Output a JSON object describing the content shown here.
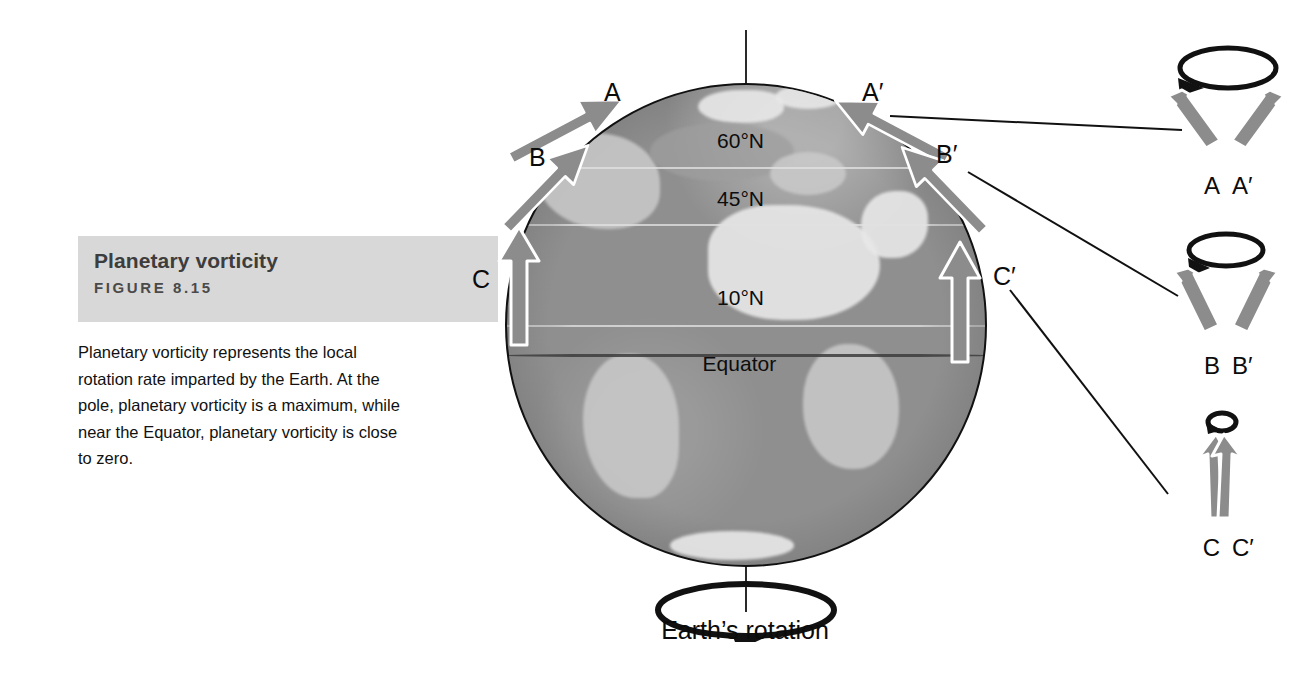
{
  "caption": {
    "title": "Planetary vorticity",
    "figure_number": "FIGURE 8.15",
    "body": "Planetary vorticity represents the local rotation rate imparted by the Earth. At the pole, planetary vorticity is a maximum, while near the Equator, planetary vorticity is close to zero."
  },
  "globe": {
    "latitudes": [
      {
        "label": "60°N"
      },
      {
        "label": "45°N"
      },
      {
        "label": "10°N"
      },
      {
        "label": "Equator"
      }
    ],
    "arrow_labels": {
      "a": "A",
      "b": "B",
      "c": "C",
      "a_prime": "A′",
      "b_prime": "B′",
      "c_prime": "C′"
    },
    "rotation_label": "Earth’s rotation"
  },
  "insets": [
    {
      "name": "high-latitude",
      "left_label": "A",
      "right_label": "A′"
    },
    {
      "name": "mid-latitude",
      "left_label": "B",
      "right_label": "B′"
    },
    {
      "name": "low-latitude",
      "left_label": "C",
      "right_label": "C′"
    }
  ],
  "colors": {
    "band": "#d8d8d8",
    "arrow_gray": "#8c8c8c",
    "outline": "#111111",
    "globe_base": "#8f8f8f"
  }
}
